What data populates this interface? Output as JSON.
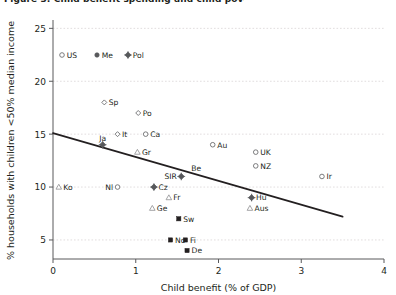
{
  "figure": {
    "title_fragment": "Figure 3:  Child benefit spending and child poverty",
    "background": "#ffffff",
    "axis_color": "#58595b",
    "grid_color": "#d9d4d6",
    "trend_color": "#231f20"
  },
  "chart_data": {
    "type": "scatter",
    "title": "",
    "xlabel": "Child benefit (% of GDP)",
    "ylabel": "% households with children <50% median income",
    "xlim": [
      0,
      4
    ],
    "ylim": [
      3.2,
      25.6
    ],
    "xticks": [
      0,
      1,
      2,
      3,
      4
    ],
    "xtick_labels": [
      "0",
      "1",
      "2",
      "3",
      "4"
    ],
    "yticks": [
      5,
      10,
      15,
      20,
      25
    ],
    "ytick_labels": [
      "5",
      "10",
      "15",
      "20",
      "25"
    ],
    "grid": "horizontal dashed at y ticks",
    "legend": {
      "position": "inside top-left",
      "entries": [
        {
          "label": "US",
          "marker": "open-circle"
        },
        {
          "label": "Me",
          "marker": "filled-circle"
        },
        {
          "label": "Pol",
          "marker": "filled-diamond"
        }
      ]
    },
    "trendline": {
      "visible": true,
      "x": [
        0.0,
        3.5
      ],
      "y": [
        15.1,
        7.2
      ],
      "style": "solid"
    },
    "points": [
      {
        "label": "Ko",
        "x": 0.07,
        "y": 10.0,
        "marker": "open-triangle",
        "label_pos": "right"
      },
      {
        "label": "Ja",
        "x": 0.6,
        "y": 14.0,
        "marker": "filled-diamond",
        "label_pos": "above"
      },
      {
        "label": "Sp",
        "x": 0.62,
        "y": 18.0,
        "marker": "open-diamond",
        "label_pos": "right"
      },
      {
        "label": "It",
        "x": 0.78,
        "y": 15.0,
        "marker": "open-diamond",
        "label_pos": "right"
      },
      {
        "label": "Nl",
        "x": 0.78,
        "y": 10.0,
        "marker": "open-circle",
        "label_pos": "left"
      },
      {
        "label": "Po",
        "x": 1.03,
        "y": 17.0,
        "marker": "open-diamond",
        "label_pos": "right"
      },
      {
        "label": "Gr",
        "x": 1.02,
        "y": 13.3,
        "marker": "open-triangle",
        "label_pos": "right"
      },
      {
        "label": "Ca",
        "x": 1.12,
        "y": 15.0,
        "marker": "open-circle",
        "label_pos": "right"
      },
      {
        "label": "Cz",
        "x": 1.22,
        "y": 10.0,
        "marker": "filled-diamond",
        "label_pos": "right"
      },
      {
        "label": "Ge",
        "x": 1.2,
        "y": 8.0,
        "marker": "open-triangle",
        "label_pos": "right"
      },
      {
        "label": "Fr",
        "x": 1.4,
        "y": 9.0,
        "marker": "open-triangle",
        "label_pos": "right"
      },
      {
        "label": "No",
        "x": 1.42,
        "y": 5.0,
        "marker": "filled-square",
        "label_pos": "right"
      },
      {
        "label": "SIR",
        "x": 1.55,
        "y": 11.0,
        "marker": "filled-diamond",
        "label_pos": "left"
      },
      {
        "label": "Sw",
        "x": 1.52,
        "y": 7.0,
        "marker": "filled-square",
        "label_pos": "right"
      },
      {
        "label": "Fi",
        "x": 1.6,
        "y": 5.0,
        "marker": "filled-square",
        "label_pos": "right"
      },
      {
        "label": "De",
        "x": 1.62,
        "y": 4.0,
        "marker": "filled-square",
        "label_pos": "right"
      },
      {
        "label": "Be",
        "x": 1.73,
        "y": 11.8,
        "marker": "none",
        "label_pos": "center"
      },
      {
        "label": "Au",
        "x": 1.93,
        "y": 14.0,
        "marker": "open-circle",
        "label_pos": "right"
      },
      {
        "label": "Aus",
        "x": 2.38,
        "y": 8.0,
        "marker": "open-triangle",
        "label_pos": "right"
      },
      {
        "label": "Hu",
        "x": 2.4,
        "y": 9.0,
        "marker": "filled-diamond",
        "label_pos": "right"
      },
      {
        "label": "UK",
        "x": 2.45,
        "y": 13.3,
        "marker": "open-circle",
        "label_pos": "right"
      },
      {
        "label": "NZ",
        "x": 2.45,
        "y": 12.0,
        "marker": "open-circle",
        "label_pos": "right"
      },
      {
        "label": "Ir",
        "x": 3.25,
        "y": 11.0,
        "marker": "open-circle",
        "label_pos": "right"
      }
    ]
  }
}
